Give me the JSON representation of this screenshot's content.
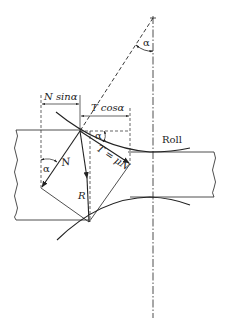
{
  "diagram": {
    "type": "rolling-force-diagram",
    "labels": {
      "n_sin": "N sinα",
      "t_cos": "T cosα",
      "alpha_top": "α",
      "alpha_contact": "α",
      "alpha_left": "α",
      "normal_force": "N",
      "friction_force": "T = μN",
      "resultant_force": "R",
      "roll": "Roll"
    },
    "colors": {
      "line": "#222222",
      "background": "#ffffff"
    }
  }
}
